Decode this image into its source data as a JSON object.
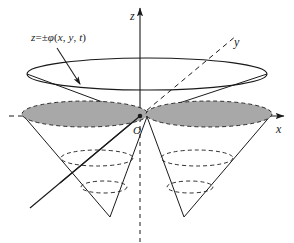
{
  "figure": {
    "background_color": "#ffffff",
    "line_color": "#1a1a1a",
    "shade_color": "#a8a8a8"
  },
  "axes": {
    "z": {
      "label": "z",
      "direction": "up",
      "style": "solid",
      "arrow": true
    },
    "y": {
      "label": "y",
      "direction": "up-right (into page)",
      "style": "dashed-positive-solid-negative",
      "arrow": false
    },
    "x": {
      "label": "x",
      "direction": "right",
      "style": "solid-positive-dashed-negative",
      "arrow": true
    },
    "origin": {
      "label": "O"
    }
  },
  "annotation": {
    "surface_equation": {
      "z": "z",
      "equals": "=",
      "pm": "±",
      "phi": "φ",
      "open": "(",
      "x": "x",
      "comma1": ",",
      "y": "y",
      "comma2": ",",
      "t": "t",
      "close": ")",
      "full_text": "z = ±φ(x, y, t)",
      "pointer": "arrow pointing down-right to the upper cone surface"
    }
  },
  "geometry": {
    "upper_rim": {
      "type": "ellipse",
      "cx": 147,
      "cy": 74,
      "rx": 120,
      "ry": 16,
      "style": "solid"
    },
    "shaded_cross_sections": [
      {
        "side": "left",
        "cx": 85,
        "cy": 114,
        "rx": 63,
        "ry": 13,
        "fill": "#a8a8a8",
        "outline": "dashed"
      },
      {
        "side": "right",
        "cx": 209,
        "cy": 114,
        "rx": 63,
        "ry": 13,
        "fill": "#a8a8a8",
        "outline": "dashed"
      }
    ],
    "dashed_level_ellipses": [
      {
        "side": "left",
        "cx": 97,
        "cy": 158,
        "rx": 36,
        "ry": 8
      },
      {
        "side": "left",
        "cx": 104,
        "cy": 187,
        "rx": 23,
        "ry": 6
      },
      {
        "side": "right",
        "cx": 197,
        "cy": 158,
        "rx": 36,
        "ry": 8
      },
      {
        "side": "right",
        "cx": 190,
        "cy": 187,
        "rx": 23,
        "ry": 6
      }
    ],
    "cone_apices": [
      {
        "side": "left",
        "x": 147,
        "y": 74
      },
      {
        "side": "right",
        "x": 147,
        "y": 74
      }
    ],
    "cone_tips": [
      {
        "side": "left",
        "x": 110,
        "y": 217
      },
      {
        "side": "right",
        "x": 184,
        "y": 217
      }
    ]
  }
}
